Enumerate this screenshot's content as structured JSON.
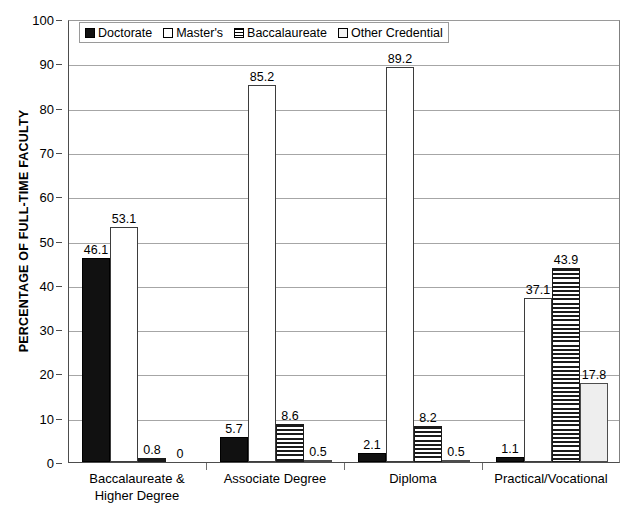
{
  "chart_data": {
    "type": "bar",
    "title": "",
    "xlabel": "",
    "ylabel": "PERCENTAGE OF FULL-TIME FACULTY",
    "ylim": [
      0,
      100
    ],
    "ytick_step": 10,
    "yticks": [
      "0",
      "10",
      "20",
      "30",
      "40",
      "50",
      "60",
      "70",
      "80",
      "90",
      "100"
    ],
    "grid": true,
    "grid_axis": "y",
    "legend_position": "top-left-inside",
    "categories": [
      "Baccalaureate &\nHigher Degree",
      "Associate Degree",
      "Diploma",
      "Practical/Vocational"
    ],
    "series": [
      {
        "name": "Doctorate",
        "pattern": "solid-black",
        "color": "#111111",
        "values": [
          46.1,
          5.7,
          2.1,
          1.1
        ],
        "labels": [
          "46.1",
          "5.7",
          "2.1",
          "1.1"
        ]
      },
      {
        "name": "Master's",
        "pattern": "open-white",
        "color": "#ffffff",
        "values": [
          53.1,
          85.2,
          89.2,
          37.1
        ],
        "labels": [
          "53.1",
          "85.2",
          "89.2",
          "37.1"
        ]
      },
      {
        "name": "Baccalaureate",
        "pattern": "horizontal-stripes",
        "color": "#1a1a1a",
        "values": [
          0.8,
          8.6,
          8.2,
          43.9
        ],
        "labels": [
          "0.8",
          "8.6",
          "8.2",
          "43.9"
        ]
      },
      {
        "name": "Other Credential",
        "pattern": "light-gray",
        "color": "#eeeeee",
        "values": [
          0,
          0.5,
          0.5,
          17.8
        ],
        "labels": [
          "0",
          "0.5",
          "0.5",
          "17.8"
        ]
      }
    ]
  },
  "legend": {
    "items": [
      {
        "label": "Doctorate"
      },
      {
        "label": "Master's"
      },
      {
        "label": "Baccalaureate"
      },
      {
        "label": "Other Credential"
      }
    ]
  }
}
